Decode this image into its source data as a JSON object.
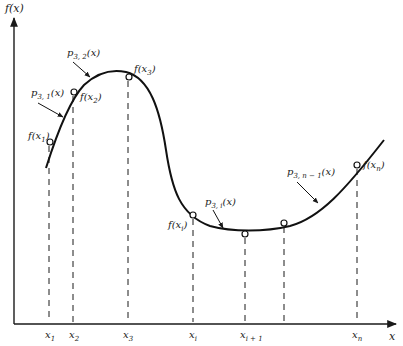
{
  "axes": {
    "y_label": "f(x)",
    "x_label": "x"
  },
  "knots": [
    {
      "id": "x1",
      "label": "x",
      "sub": "1",
      "x": 49
    },
    {
      "id": "x2",
      "label": "x",
      "sub": "2",
      "x": 73
    },
    {
      "id": "x3",
      "label": "x",
      "sub": "3",
      "x": 127
    },
    {
      "id": "xi",
      "label": "x",
      "sub": "i",
      "x": 193
    },
    {
      "id": "xi1",
      "label": "x",
      "sub": "i + 1",
      "x": 245
    },
    {
      "id": "xunl",
      "label": "",
      "sub": "",
      "x": 284
    },
    {
      "id": "xn",
      "label": "x",
      "sub": "n",
      "x": 357
    }
  ],
  "point_labels": {
    "fx1": {
      "main": "f(x",
      "sub": "1",
      "close": ")"
    },
    "fx2": {
      "main": "f(x",
      "sub": "2",
      "close": ")"
    },
    "fx3": {
      "main": "f(x",
      "sub": "3",
      "close": ")"
    },
    "fxi": {
      "main": "f(x",
      "sub": "i",
      "close": ")"
    },
    "fxn": {
      "main": "f(x",
      "sub": "n",
      "close": ")"
    }
  },
  "pieces": {
    "p31": {
      "main": "p",
      "sub": "3, 1",
      "arg": "(x)"
    },
    "p32": {
      "main": "p",
      "sub": "3, 2",
      "arg": "(x)"
    },
    "p3i": {
      "main": "p",
      "sub": "3, i",
      "arg": "(x)"
    },
    "p3n1": {
      "main": "p",
      "sub": "3, n − 1",
      "arg": "(x)"
    }
  }
}
